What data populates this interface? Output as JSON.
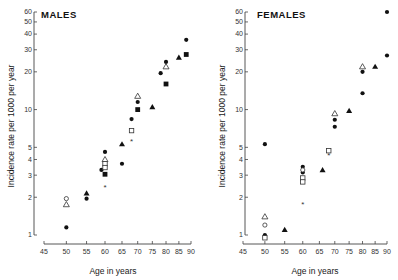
{
  "chart_data": [
    {
      "type": "scatter",
      "title": "MALES",
      "xlabel": "Age in years",
      "ylabel": "Incidence rate per 1000 per year",
      "xscale": "log",
      "yscale": "log",
      "xlim": [
        45,
        90
      ],
      "ylim": [
        1,
        60
      ],
      "xticks": [
        45,
        50,
        55,
        60,
        65,
        70,
        75,
        80,
        85,
        90
      ],
      "yticks": [
        1,
        2,
        3,
        4,
        5,
        10,
        20,
        30,
        40,
        50,
        60
      ],
      "grid": false,
      "series": [
        {
          "name": "filled-circle",
          "marker": "circle-filled",
          "points": [
            [
              50,
              1.15
            ],
            [
              55,
              1.95
            ],
            [
              59,
              3.3
            ],
            [
              60,
              4.6
            ],
            [
              65,
              3.7
            ],
            [
              68,
              8.4
            ],
            [
              70,
              11.5
            ],
            [
              78,
              19.5
            ],
            [
              80,
              24
            ],
            [
              88,
              36
            ]
          ]
        },
        {
          "name": "open-circle",
          "marker": "circle-open",
          "points": [
            [
              50,
              1.95
            ]
          ]
        },
        {
          "name": "open-triangle",
          "marker": "triangle-open",
          "points": [
            [
              50,
              1.75
            ],
            [
              60,
              4.0
            ],
            [
              70,
              12.8
            ],
            [
              80,
              22
            ]
          ]
        },
        {
          "name": "filled-triangle",
          "marker": "triangle-filled",
          "points": [
            [
              55,
              2.15
            ],
            [
              65,
              5.3
            ],
            [
              75,
              10.5
            ],
            [
              85,
              26
            ]
          ]
        },
        {
          "name": "open-square",
          "marker": "square-open",
          "points": [
            [
              60,
              3.7
            ],
            [
              60,
              3.45
            ],
            [
              68,
              6.8
            ]
          ]
        },
        {
          "name": "filled-square",
          "marker": "square-filled",
          "points": [
            [
              60,
              3.05
            ],
            [
              70,
              10
            ],
            [
              80,
              16
            ],
            [
              88,
              27.5
            ]
          ]
        },
        {
          "name": "star",
          "marker": "star",
          "points": [
            [
              60,
              2.4
            ],
            [
              68,
              5.6
            ]
          ]
        }
      ]
    },
    {
      "type": "scatter",
      "title": "FEMALES",
      "xlabel": "Age in years",
      "ylabel": "Incidence rate per 1000 per year",
      "xscale": "log",
      "yscale": "log",
      "xlim": [
        45,
        90
      ],
      "ylim": [
        1,
        60
      ],
      "xticks": [
        45,
        50,
        55,
        60,
        65,
        70,
        75,
        80,
        85,
        90
      ],
      "yticks": [
        1,
        2,
        3,
        4,
        5,
        10,
        20,
        30,
        40,
        50,
        60
      ],
      "grid": false,
      "series": [
        {
          "name": "filled-circle",
          "marker": "circle-filled",
          "points": [
            [
              50,
              5.3
            ],
            [
              50,
              1.0
            ],
            [
              60,
              3.5
            ],
            [
              60,
              3.15
            ],
            [
              70,
              8.3
            ],
            [
              70,
              7.3
            ],
            [
              80,
              20
            ],
            [
              80,
              13.5
            ],
            [
              90,
              60
            ],
            [
              90,
              27
            ]
          ]
        },
        {
          "name": "open-circle",
          "marker": "circle-open",
          "points": [
            [
              50,
              1.2
            ],
            [
              60,
              3.3
            ]
          ]
        },
        {
          "name": "open-triangle",
          "marker": "triangle-open",
          "points": [
            [
              50,
              1.4
            ],
            [
              70,
              9.3
            ],
            [
              80,
              22
            ]
          ]
        },
        {
          "name": "filled-triangle",
          "marker": "triangle-filled",
          "points": [
            [
              55,
              1.1
            ],
            [
              66,
              3.3
            ],
            [
              75,
              9.8
            ],
            [
              85,
              22
            ]
          ]
        },
        {
          "name": "open-square",
          "marker": "square-open",
          "points": [
            [
              50,
              0.95
            ],
            [
              60,
              2.85
            ],
            [
              60,
              2.65
            ],
            [
              68,
              4.7
            ]
          ]
        },
        {
          "name": "star",
          "marker": "star",
          "points": [
            [
              60,
              1.75
            ],
            [
              68,
              4.3
            ]
          ]
        }
      ]
    }
  ],
  "panels": [
    {
      "title": "MALES",
      "xlabel": "Age in years",
      "ylabel": "Incidence rate per 1000 per year"
    },
    {
      "title": "FEMALES",
      "xlabel": "Age in years",
      "ylabel": "Incidence rate per 1000 per year"
    }
  ]
}
